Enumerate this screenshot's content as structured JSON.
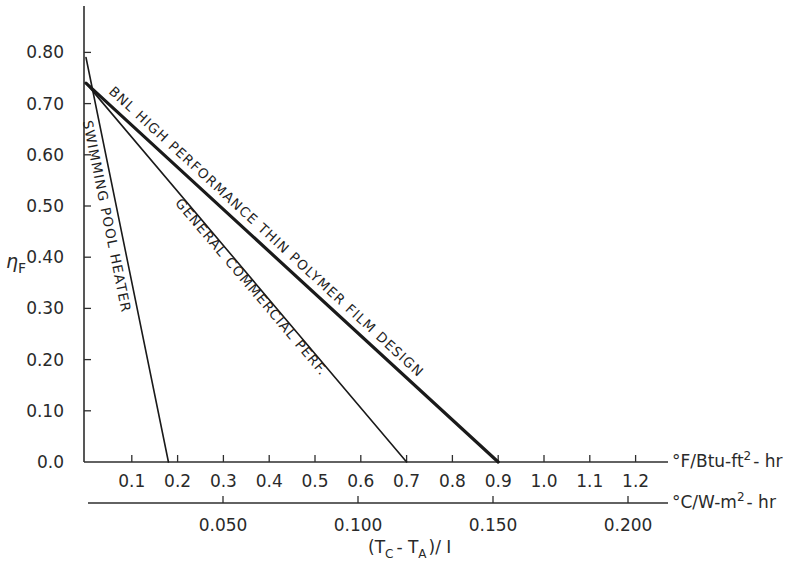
{
  "chart_data": {
    "type": "line",
    "title": "",
    "ylabel": "η_F",
    "xlabel": "(T_C - T_A) / I",
    "x_axis_primary": {
      "unit": "°F/Btu-ft²-hr",
      "range": [
        0,
        1.25
      ],
      "ticks": [
        0.1,
        0.2,
        0.3,
        0.4,
        0.5,
        0.6,
        0.7,
        0.8,
        0.9,
        1.0,
        1.1,
        1.2
      ],
      "tick_labels": [
        "0.1",
        "0.2",
        "0.3",
        "0.4",
        "0.5",
        "0.6",
        "0.7",
        "0.8",
        "0.9",
        "1.0",
        "1.1",
        "1.2"
      ]
    },
    "x_axis_secondary": {
      "unit": "°C/W-m²-hr",
      "ticks": [
        0.05,
        0.1,
        0.15,
        0.2
      ],
      "tick_labels": [
        "0.050",
        "0.100",
        "0.150",
        "0.200"
      ]
    },
    "y_axis": {
      "range": [
        0,
        0.85
      ],
      "ticks": [
        0.0,
        0.1,
        0.2,
        0.3,
        0.4,
        0.5,
        0.6,
        0.7,
        0.8
      ],
      "tick_labels": [
        "0.0",
        "0.10",
        "0.20",
        "0.30",
        "0.40",
        "0.50",
        "0.60",
        "0.70",
        "0.80"
      ]
    },
    "grid": false,
    "legend": "inline labels along lines",
    "series": [
      {
        "name": "SWIMMING POOL HEATER",
        "x": [
          0.0,
          0.18
        ],
        "y": [
          0.79,
          0.0
        ],
        "weight": "normal"
      },
      {
        "name": "GENERAL COMMERCIAL PERF.",
        "x": [
          0.0,
          0.7
        ],
        "y": [
          0.74,
          0.0
        ],
        "weight": "normal"
      },
      {
        "name": "BNL HIGH PERFORMANCE THIN POLYMER FILM DESIGN",
        "x": [
          0.0,
          0.9
        ],
        "y": [
          0.74,
          0.0
        ],
        "weight": "bold"
      }
    ]
  },
  "labels": {
    "y_axis_symbol": "η",
    "y_axis_sub": "F",
    "unit_primary_a": "°F/Btu-ft",
    "unit_primary_sup": "2",
    "unit_primary_b": "- hr",
    "unit_secondary_a": "°C/W-m",
    "unit_secondary_sup": "2",
    "unit_secondary_b": "- hr",
    "x_title_open": "(T",
    "x_title_sub1": "C",
    "x_title_mid": "- T",
    "x_title_sub2": "A",
    "x_title_close": ")/ I"
  }
}
